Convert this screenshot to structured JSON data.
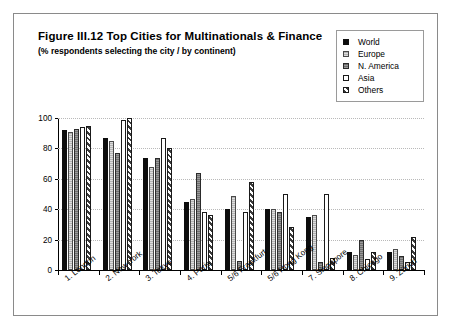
{
  "figure": {
    "title": "Figure III.12  Top Cities for Multinationals & Finance",
    "subtitle": "(% respondents selecting the city / by continent)"
  },
  "legend": {
    "position": "top-right",
    "items": [
      {
        "label": "World",
        "swatch": "solid-black-swatch"
      },
      {
        "label": "Europe",
        "swatch": "light-gray-swatch"
      },
      {
        "label": "N. America",
        "swatch": "dark-gray-swatch"
      },
      {
        "label": "Asia",
        "swatch": "white-swatch"
      },
      {
        "label": "Others",
        "swatch": "hatched-swatch"
      }
    ]
  },
  "axes": {
    "y_ticks": [
      "0",
      "20",
      "40",
      "60",
      "80",
      "100"
    ],
    "x_labels": [
      "1. London",
      "2. New York",
      "3. Tokyo",
      "4. Paris",
      "5/6 Frankfurt",
      "5/6 Hong Kong",
      "7. Singapore",
      "8. Chicago",
      "9. Zürich"
    ]
  },
  "chart_data": {
    "type": "bar",
    "title": "Figure III.12  Top Cities for Multinationals & Finance",
    "subtitle": "(% respondents selecting the city / by continent)",
    "xlabel": "",
    "ylabel": "",
    "ylim": [
      0,
      100
    ],
    "grid": true,
    "legend_position": "top-right",
    "categories": [
      "1. London",
      "2. New York",
      "3. Tokyo",
      "4. Paris",
      "5/6 Frankfurt",
      "5/6 Hong Kong",
      "7. Singapore",
      "8. Chicago",
      "9. Zürich"
    ],
    "series": [
      {
        "name": "World",
        "values": [
          92,
          87,
          74,
          45,
          40,
          40,
          35,
          12,
          12
        ]
      },
      {
        "name": "Europe",
        "values": [
          91,
          85,
          68,
          47,
          49,
          40,
          36,
          10,
          14
        ]
      },
      {
        "name": "N. America",
        "values": [
          93,
          77,
          74,
          64,
          6,
          38,
          5,
          20,
          9
        ]
      },
      {
        "name": "Asia",
        "values": [
          94,
          99,
          87,
          38,
          38,
          50,
          50,
          7,
          5
        ]
      },
      {
        "name": "Others",
        "values": [
          95,
          100,
          80,
          36,
          58,
          28,
          8,
          12,
          22
        ]
      }
    ]
  }
}
